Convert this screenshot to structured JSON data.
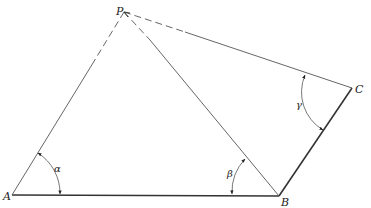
{
  "figure": {
    "points": {
      "P": {
        "label": "P",
        "x": 124,
        "y": 12
      },
      "A": {
        "label": "A",
        "x": 12,
        "y": 195
      },
      "B": {
        "label": "B",
        "x": 279,
        "y": 196
      },
      "C": {
        "label": "C",
        "x": 352,
        "y": 88
      }
    },
    "angles": {
      "alpha": {
        "label": "α",
        "at": "A"
      },
      "beta": {
        "label": "β",
        "at": "B"
      },
      "gamma": {
        "label": "γ",
        "at": "C"
      }
    },
    "segments": [
      {
        "from": "A",
        "to": "B",
        "style": "solid-thick"
      },
      {
        "from": "B",
        "to": "C",
        "style": "solid-thick"
      },
      {
        "from": "P",
        "to": "A",
        "style": "dashed-then-solid"
      },
      {
        "from": "P",
        "to": "B",
        "style": "dashed-then-solid"
      },
      {
        "from": "P",
        "to": "C",
        "style": "dashed-then-solid"
      }
    ],
    "colors": {
      "line": "#333333",
      "thin_line": "#555555",
      "background": "#ffffff"
    }
  }
}
